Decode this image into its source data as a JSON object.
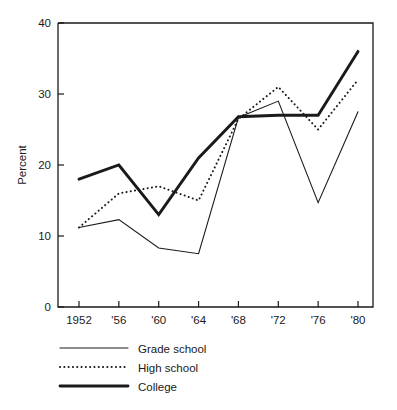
{
  "chart_data": {
    "type": "line",
    "title": "",
    "subtitle": "",
    "xlabel": "",
    "ylabel": "Percent",
    "x": [
      1952,
      1956,
      1960,
      1964,
      1968,
      1972,
      1976,
      1980
    ],
    "categories": [
      "1952",
      "'56",
      "'60",
      "'64",
      "'68",
      "'72",
      "'76",
      "'80"
    ],
    "xlim": [
      1952,
      1980
    ],
    "ylim": [
      0,
      40
    ],
    "yticks": [
      0,
      10,
      20,
      30,
      40
    ],
    "ytick_labels": [
      "0",
      "10",
      "20",
      "30",
      "40"
    ],
    "grid": false,
    "legend_position": "below-left",
    "series": [
      {
        "name": "Grade school",
        "style": "thin-solid",
        "color": "#1a1a1a",
        "values": [
          11.2,
          12.3,
          8.3,
          7.5,
          26.7,
          29.0,
          14.7,
          27.5
        ]
      },
      {
        "name": "High school",
        "style": "dotted",
        "color": "#1a1a1a",
        "values": [
          11.2,
          16.0,
          17.0,
          15.0,
          26.5,
          31.0,
          25.0,
          32.0
        ]
      },
      {
        "name": "College",
        "style": "thick-solid",
        "color": "#1a1a1a",
        "values": [
          18.0,
          20.0,
          13.0,
          21.0,
          26.8,
          27.0,
          27.0,
          36.0
        ]
      }
    ]
  },
  "axes": {
    "y_axis_title": "Percent"
  },
  "legend": {
    "items": [
      {
        "label": "Grade school",
        "style": "thin-solid"
      },
      {
        "label": "High school",
        "style": "dotted"
      },
      {
        "label": "College",
        "style": "thick-solid"
      }
    ]
  }
}
